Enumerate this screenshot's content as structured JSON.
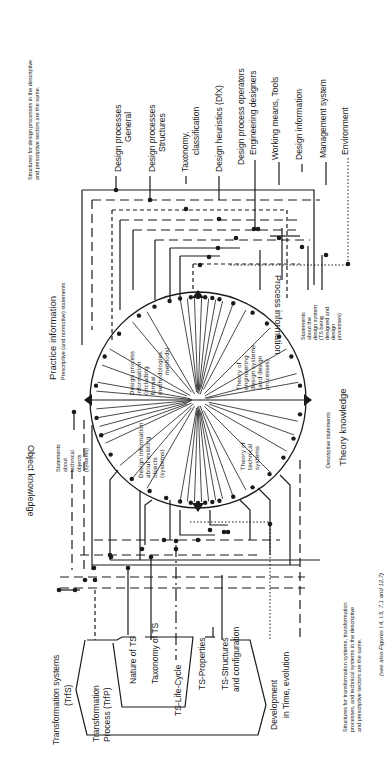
{
  "diagram": {
    "caption_top": {
      "line1": "Structures for design processes in the descriptive",
      "line2": "and prescriptive sectors are the same."
    },
    "caption_bottom": {
      "line1": "Structures for transformation systems, transformation",
      "line2": "processes, and technical systems in the descriptive",
      "line3": "and prescriptive sectors are the same."
    },
    "see_also": "(see also Figures I.4, I.5, 7.1 and 12.7)",
    "sectors": {
      "practice": {
        "title": "Practice information",
        "subtitle": "Prescriptive (and normative) statements"
      },
      "theory": {
        "title": "Theory knowledge",
        "subtitle": "Descriptive statements"
      },
      "object": {
        "title": "Object knowledge",
        "subtitle": [
          "Statements",
          "about",
          "technical",
          "objects",
          "(systems)"
        ]
      },
      "process": {
        "title": "Process information",
        "subtitle": [
          "Statements",
          "about the",
          "design system",
          "(TS being",
          "designed and",
          "design",
          "processes)"
        ]
      }
    },
    "quadrants": {
      "design_process_info": [
        "Design process",
        "information",
        "(including",
        "formal",
        "methodologies,",
        "methods)"
      ],
      "theory_eng_design": [
        "Theory of",
        "engineering",
        "design systems",
        "(and design",
        "processes)"
      ],
      "design_info_existing": [
        "Design information",
        "about existing",
        "objects",
        "(systems)"
      ],
      "theory_technical": [
        "Theory of",
        "technical",
        "systems"
      ]
    },
    "design_side_labels": [
      {
        "lines": [
          "Design processes",
          "General"
        ]
      },
      {
        "lines": [
          "Design processes",
          "Structures"
        ]
      },
      {
        "lines": [
          "Taxonomy,",
          "classification"
        ]
      },
      {
        "lines": [
          "Design heuristics (DfX)"
        ]
      },
      {
        "lines": [
          "Design process operators",
          "Engineering designers"
        ]
      },
      {
        "lines": [
          "Working means, Tools"
        ]
      },
      {
        "lines": [
          "Design information"
        ]
      },
      {
        "lines": [
          "Management system"
        ]
      },
      {
        "lines": [
          "Environment"
        ]
      }
    ],
    "ts_side_labels": {
      "trfs": [
        "Transformation systems",
        "(TrfS)"
      ],
      "trfp": [
        "Transformation",
        "Process  (TrfP)"
      ],
      "nature": "Nature of TS",
      "taxonomy": "Taxonomy of TS",
      "lifecycle": "TS-Life-Cycle",
      "properties": "TS-Properties",
      "structures": [
        "TS-Structures",
        "and configuration"
      ],
      "development": [
        "Development",
        "in Time, evolution"
      ]
    }
  }
}
